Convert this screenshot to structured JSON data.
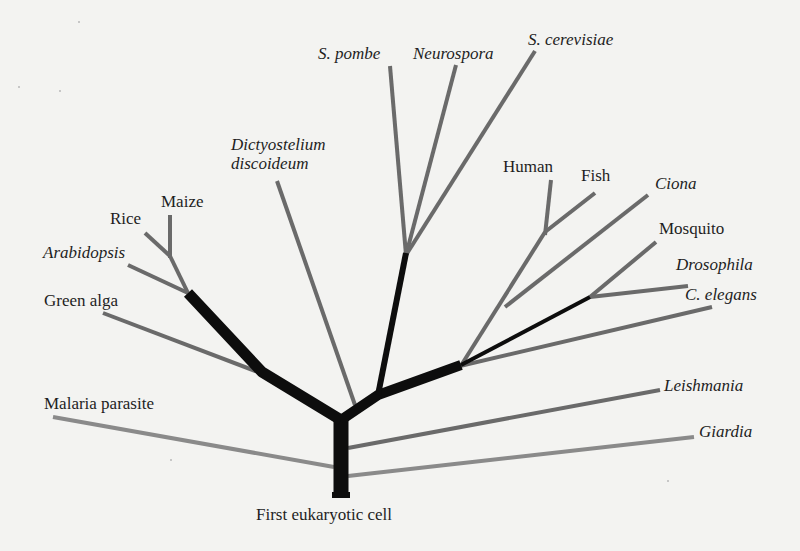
{
  "diagram": {
    "type": "phylogenetic-tree",
    "root_label": "First eukaryotic cell",
    "colors": {
      "background": "#f3f3f1",
      "thick_branch": "#0d0d0d",
      "gray_branch": "#6e6e6e",
      "light_branch": "#8c8c8c",
      "text": "#1e1e1e"
    },
    "taxa": [
      {
        "id": "malaria",
        "label": "Malaria parasite",
        "italic": false
      },
      {
        "id": "green-alga",
        "label": "Green alga",
        "italic": false
      },
      {
        "id": "arabidopsis",
        "label": "Arabidopsis",
        "italic": true
      },
      {
        "id": "rice",
        "label": "Rice",
        "italic": false
      },
      {
        "id": "maize",
        "label": "Maize",
        "italic": false
      },
      {
        "id": "dictyostelium",
        "label": "Dictyostelium\ndiscoideum",
        "italic": true
      },
      {
        "id": "s-pombe",
        "label": "S. pombe",
        "italic": true
      },
      {
        "id": "neurospora",
        "label": "Neurospora",
        "italic": true
      },
      {
        "id": "s-cerevisiae",
        "label": "S. cerevisiae",
        "italic": true
      },
      {
        "id": "human",
        "label": "Human",
        "italic": false
      },
      {
        "id": "fish",
        "label": "Fish",
        "italic": false
      },
      {
        "id": "ciona",
        "label": "Ciona",
        "italic": true
      },
      {
        "id": "mosquito",
        "label": "Mosquito",
        "italic": false
      },
      {
        "id": "drosophila",
        "label": "Drosophila",
        "italic": true
      },
      {
        "id": "c-elegans",
        "label": "C. elegans",
        "italic": true
      },
      {
        "id": "leishmania",
        "label": "Leishmania",
        "italic": true
      },
      {
        "id": "giardia",
        "label": "Giardia",
        "italic": true
      }
    ]
  }
}
